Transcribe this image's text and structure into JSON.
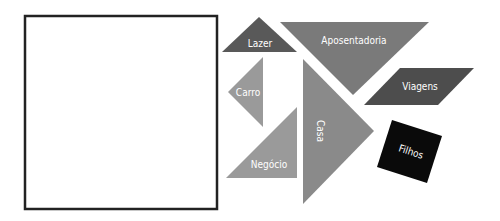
{
  "board": {
    "label": "",
    "border_color": "#222222"
  },
  "pieces": {
    "lazer": {
      "label": "Lazer",
      "color": "#595959"
    },
    "aposentadoria": {
      "label": "Aposentadoria",
      "color": "#7a7a7a"
    },
    "viagens": {
      "label": "Viagens",
      "color": "#4d4d4d"
    },
    "carro": {
      "label": "Carro",
      "color": "#9a9a9a"
    },
    "negocio": {
      "label": "Negócio",
      "color": "#9a9a9a"
    },
    "casa": {
      "label": "Casa",
      "color": "#8a8a8a"
    },
    "filhos": {
      "label": "Filhos",
      "color": "#0a0a0a"
    }
  }
}
